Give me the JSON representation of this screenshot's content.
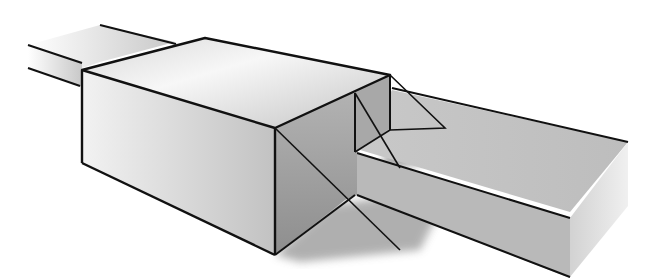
{
  "illustration": {
    "subject": "3D line drawing of a rectangular box mounted on a long rectangular beam, with shaded faces and cast shadow",
    "colors": {
      "outline": "#111111",
      "top_light": "#f4f4f4",
      "face_mid": "#cfcfcf",
      "face_dark": "#9a9a9a",
      "shadow": "#8a8a8a",
      "background": "#ffffff"
    }
  }
}
